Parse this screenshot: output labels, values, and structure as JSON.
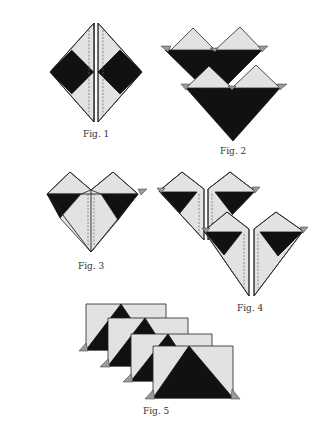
{
  "colors": {
    "light_paper": "#e2e2e2",
    "dark_paper": "#111111",
    "tab_gray": "#9a9a9a",
    "line": "#222222",
    "background": "#ffffff"
  },
  "figures": [
    {
      "id": "fig1",
      "caption": "Fig. 1",
      "description": "Square folded with two half-diamonds separated by center slit, dark corner squares on left and right"
    },
    {
      "id": "fig2",
      "caption": "Fig. 2",
      "description": "Two heart units stacked, back unit offset up-left, dark V-shaped lower triangles with light peaks"
    },
    {
      "id": "fig3",
      "caption": "Fig. 3",
      "description": "Single heart unit with center seam dashed lines, dark bands under light peaks"
    },
    {
      "id": "fig4",
      "caption": "Fig. 4",
      "description": "Two heart units with center slits, second offset down-right"
    },
    {
      "id": "fig5",
      "caption": "Fig. 5",
      "description": "Four rectangular folded units stacked diagonally with dark triangles and gray corner tabs"
    }
  ]
}
